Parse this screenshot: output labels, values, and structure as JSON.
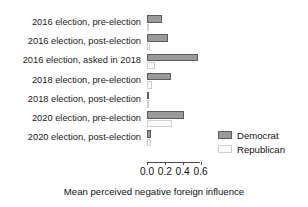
{
  "chart_data": {
    "type": "bar",
    "orientation": "horizontal",
    "title": "",
    "xlabel": "Mean perceived negative foreign influence",
    "ylabel": "",
    "xlim": [
      0.0,
      0.65
    ],
    "xticks": [
      0.0,
      0.2,
      0.4,
      0.6
    ],
    "xticklabels": [
      "0.0",
      "0.2",
      "0.4",
      "0.6"
    ],
    "grid": false,
    "legend_position": "right",
    "categories": [
      "2016 election, pre-election",
      "2016 election, post-election",
      "2016 election, asked in 2018",
      "2018 election, pre-election",
      "2018 election, post-election",
      "2020 election, pre-election",
      "2020 election, post-election"
    ],
    "series": [
      {
        "name": "Democrat",
        "color": "#9a9a9a",
        "values": [
          0.17,
          0.23,
          0.57,
          0.27,
          0.02,
          0.42,
          0.05
        ]
      },
      {
        "name": "Republican",
        "color": "#fbfbfb",
        "values": [
          0.02,
          0.03,
          0.09,
          0.06,
          0.01,
          0.28,
          0.04
        ]
      }
    ]
  },
  "legend": {
    "entries": [
      {
        "label": "Democrat",
        "swatch": "dem"
      },
      {
        "label": "Republican",
        "swatch": "rep"
      }
    ]
  }
}
